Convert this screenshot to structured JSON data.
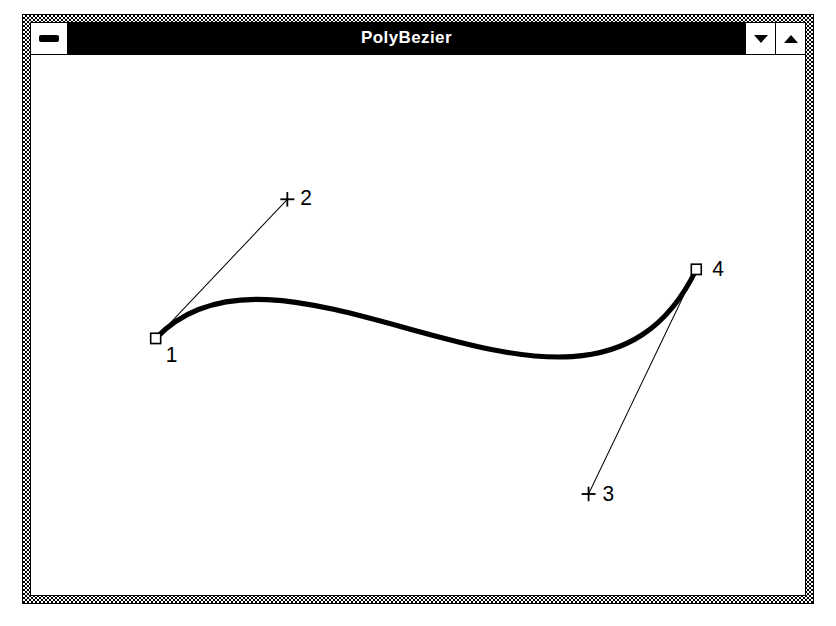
{
  "window": {
    "title": "PolyBezier",
    "system_menu_icon": "minimize-bar-icon",
    "minimize_icon": "triangle-down-icon",
    "maximize_icon": "triangle-up-icon",
    "frame_color": "#000000",
    "titlebar_bg": "#000000",
    "titlebar_fg": "#ffffff",
    "client_bg": "#ffffff"
  },
  "chart_data": {
    "type": "line",
    "title": "PolyBezier",
    "xlabel": "",
    "ylabel": "",
    "coordinate_space": "client-area pixels, origin at top-left of the white drawing area",
    "curve_color": "#000000",
    "curve_width": 5,
    "handle_line_color": "#000000",
    "handle_line_width": 1,
    "points": [
      {
        "label": "1",
        "role": "endpoint",
        "marker": "square",
        "x": 125,
        "y": 275,
        "label_x": 135,
        "label_y": 298
      },
      {
        "label": "2",
        "role": "controlpoint",
        "marker": "cross",
        "x": 257,
        "y": 140,
        "label_x": 270,
        "label_y": 146
      },
      {
        "label": "3",
        "role": "controlpoint",
        "marker": "cross",
        "x": 559,
        "y": 426,
        "label_x": 573,
        "label_y": 433
      },
      {
        "label": "4",
        "role": "endpoint",
        "marker": "square",
        "x": 667,
        "y": 208,
        "label_x": 683,
        "label_y": 214
      }
    ],
    "bezier_path": "M125,275 C257,140 559,426 667,208",
    "handles": [
      {
        "from": "1",
        "to": "2"
      },
      {
        "from": "3",
        "to": "4"
      }
    ]
  }
}
